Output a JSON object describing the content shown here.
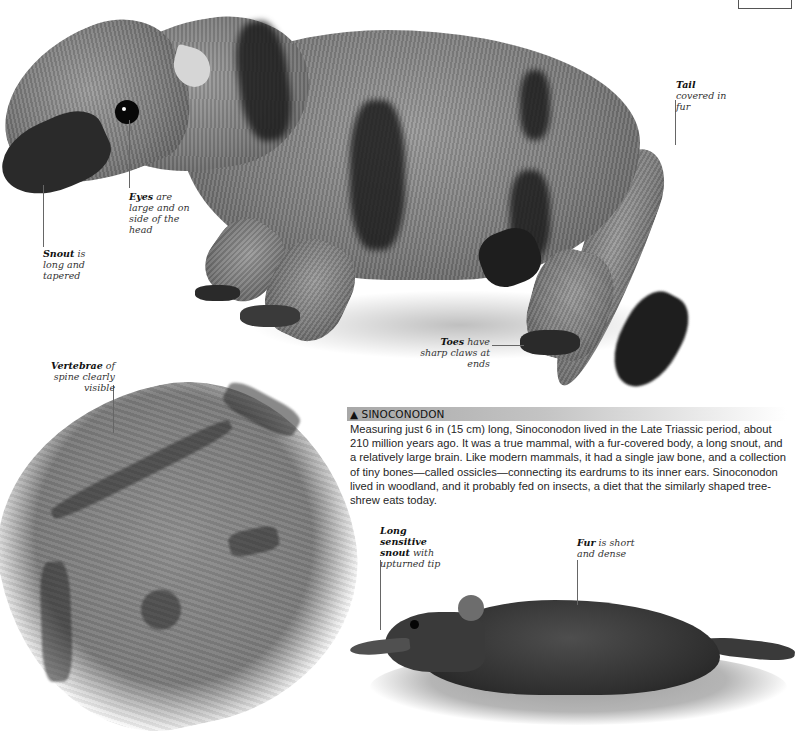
{
  "page": {
    "number": "15"
  },
  "figures": {
    "sinoconodon": {
      "name": "Sinoconodon reconstruction"
    },
    "fossil": {
      "name": "Sinoconodon fossil"
    },
    "shrew": {
      "name": "Tree-shrew"
    }
  },
  "callouts": {
    "eyes": {
      "term": "Eyes",
      "text": " are large and on side of the head"
    },
    "snout": {
      "term": "Snout",
      "text": " is long and tapered"
    },
    "tail": {
      "term": "Tail",
      "text": " covered in fur"
    },
    "toes": {
      "term": "Toes",
      "text": " have sharp claws at ends"
    },
    "vertebrae": {
      "term": "Vertebrae",
      "text": " of spine clearly visible"
    },
    "long_snout": {
      "term": "Long sensitive snout",
      "text": " with upturned tip"
    },
    "fur": {
      "term": "Fur",
      "text": " is short and dense"
    }
  },
  "article": {
    "heading": "▲ SINOCONODON",
    "body": "Measuring just 6 in (15 cm) long, Sinoconodon lived in the Late Triassic period, about 210 million years ago. It was a true mammal, with a fur-covered body, a long snout, and a relatively large brain. Like modern mammals, it had a single jaw bone, and a collection of tiny bones—called ossicles—connecting its eardrums to its inner ears. Sinoconodon lived in woodland, and it probably fed on insects, a diet that the similarly shaped tree-shrew eats today."
  }
}
